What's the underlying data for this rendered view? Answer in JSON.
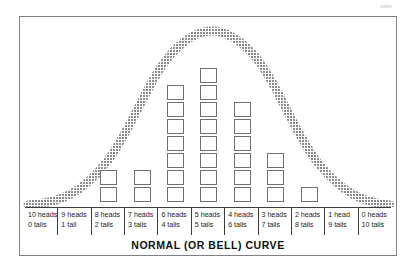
{
  "figure": {
    "title": "NORMAL (OR BELL) CURVE",
    "frame_color": "#7e8084",
    "curve_color": "#8f9194",
    "block_border_color": "#6e7073",
    "axis_rule_color": "#3a3c3f"
  },
  "chart_data": {
    "type": "bar",
    "title": "NORMAL (OR BELL) CURVE",
    "xlabel": "",
    "ylabel": "",
    "grid": false,
    "legend": "none",
    "unit": "blocks",
    "categories": [
      "10 heads / 0 tails",
      "9 heads / 1 tail",
      "8 heads / 2 tails",
      "7 heads / 3 tails",
      "6 heads / 4 tails",
      "5 heads / 5 tails",
      "4 heads / 6 tails",
      "3 heads / 7 tails",
      "2 heads / 8 tails",
      "1 head / 9 tails",
      "0 heads / 10 tails"
    ],
    "values": [
      0,
      0,
      2,
      2,
      7,
      8,
      6,
      3,
      1,
      0,
      0
    ],
    "ylim": [
      0,
      9
    ],
    "annotations": [
      "Overlaid smooth bell-shaped normal curve peaking at the 5 heads / 5 tails column"
    ],
    "overlay_curve": {
      "type": "line",
      "name": "normal curve",
      "peak_category": "5 heads / 5 tails"
    }
  },
  "axis": {
    "cells": [
      {
        "heads": "10 heads",
        "tails": "0 tails"
      },
      {
        "heads": "9 heads",
        "tails": "1 tail"
      },
      {
        "heads": "8 heads",
        "tails": "2 tails"
      },
      {
        "heads": "7 heads",
        "tails": "3 tails"
      },
      {
        "heads": "6 heads",
        "tails": "4 tails"
      },
      {
        "heads": "5 heads",
        "tails": "5 tails"
      },
      {
        "heads": "4 heads",
        "tails": "6 tails"
      },
      {
        "heads": "3 heads",
        "tails": "7 tails"
      },
      {
        "heads": "2 heads",
        "tails": "8 tails"
      },
      {
        "heads": "1 head",
        "tails": "9 tails"
      },
      {
        "heads": "0 heads",
        "tails": "10 tails"
      }
    ]
  }
}
